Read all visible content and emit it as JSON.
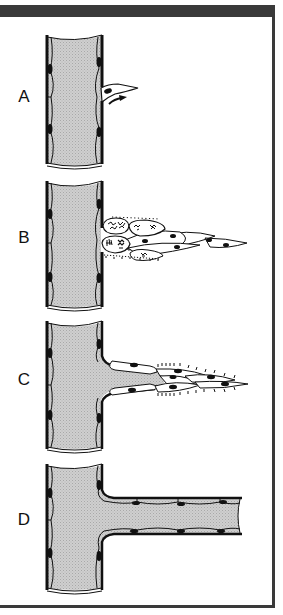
{
  "figure": {
    "colors": {
      "frame": "#3a3a3a",
      "lumen": "#c8c8c8",
      "outline": "#111111",
      "background": "#ffffff"
    },
    "panels": [
      {
        "label": "A",
        "description": "Parent vessel with single endothelial cell beginning to migrate out (arrow)"
      },
      {
        "label": "B",
        "description": "Proliferating and migrating endothelial cells forming a sprout"
      },
      {
        "label": "C",
        "description": "Sprout with lumen forming, tip cells with filopodia"
      },
      {
        "label": "D",
        "description": "Mature lumenized branch vessel lined by endothelial cells"
      }
    ]
  }
}
